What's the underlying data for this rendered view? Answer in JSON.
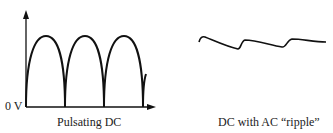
{
  "left_panel": {
    "y_axis_label": "0 V",
    "caption": "Pulsating DC",
    "waveform": "full-wave rectified sine"
  },
  "right_panel": {
    "caption": "DC with AC “ripple”",
    "waveform": "ripple"
  },
  "colors": {
    "stroke": "#111111",
    "text": "#222222",
    "background": "#ffffff"
  }
}
